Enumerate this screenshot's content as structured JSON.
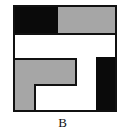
{
  "figure": {
    "label": "B",
    "colors": {
      "black": "#0a0a0a",
      "gray": "#a6a6a6",
      "white": "#ffffff",
      "outline": "#111111"
    },
    "regions": [
      {
        "name": "top-left-black-block",
        "fill": "black"
      },
      {
        "name": "top-right-gray-block",
        "fill": "gray"
      },
      {
        "name": "middle-white-band",
        "fill": "white"
      },
      {
        "name": "lower-left-gray-l-shape",
        "fill": "gray"
      },
      {
        "name": "lower-center-white-area",
        "fill": "white"
      },
      {
        "name": "right-black-bar",
        "fill": "black"
      }
    ]
  }
}
